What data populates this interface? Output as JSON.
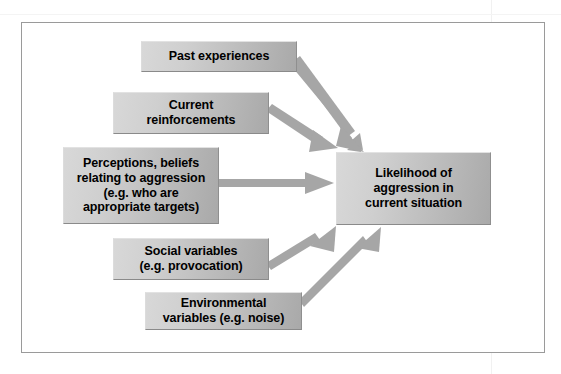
{
  "figure": {
    "kind": "flow-diagram",
    "title": "Likelihood of aggression in current situation"
  },
  "nodes": {
    "past_experiences": {
      "label": "Past experiences",
      "role": "input-factor"
    },
    "current_reinforcements": {
      "label": "Current\nreinforcements",
      "role": "input-factor"
    },
    "perceptions": {
      "label": "Perceptions, beliefs\nrelating to aggression\n(e.g. who are\nappropriate targets)",
      "role": "input-factor"
    },
    "social_variables": {
      "label": "Social variables\n(e.g. provocation)",
      "role": "input-factor"
    },
    "environmental_variables": {
      "label": "Environmental\nvariables (e.g. noise)",
      "role": "input-factor"
    },
    "outcome": {
      "label": "Likelihood of\naggression in\ncurrent situation",
      "role": "outcome"
    }
  },
  "edges": [
    {
      "id": "edge-past-experiences",
      "from": "past_experiences",
      "to": "outcome",
      "direction": "down-right"
    },
    {
      "id": "edge-current-reinforcements",
      "from": "current_reinforcements",
      "to": "outcome",
      "direction": "down-right"
    },
    {
      "id": "edge-perceptions",
      "from": "perceptions",
      "to": "outcome",
      "direction": "right"
    },
    {
      "id": "edge-social-variables",
      "from": "social_variables",
      "to": "outcome",
      "direction": "up-right"
    },
    {
      "id": "edge-environmental-variables",
      "from": "environmental_variables",
      "to": "outcome",
      "direction": "up-right"
    }
  ],
  "colors": {
    "box_fill_light": "#d8d8d8",
    "box_fill_dark": "#a9a9a9",
    "arrow": "#a6a6a6",
    "frame_border": "#9a9a9a",
    "text": "#000000",
    "page_background": "#ffffff"
  }
}
